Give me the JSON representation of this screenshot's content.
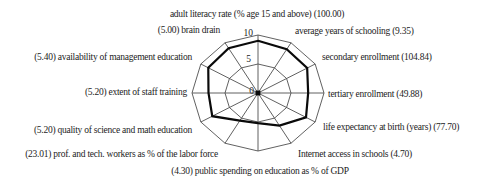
{
  "figure": {
    "background": "#ffffff",
    "text_color": "#1c1c1c",
    "grid_color": "#4f4f4f",
    "series_color": "#0a0a0a"
  },
  "chart_data": {
    "type": "radar",
    "title": "",
    "legend": [],
    "grid": true,
    "scale": {
      "min": 0,
      "max": 10,
      "rings": [
        5,
        10
      ],
      "ticks": [
        "0",
        "5",
        "10"
      ]
    },
    "axes": [
      {
        "label": "adult literacy rate (% age 15 and above) (100.00)",
        "actual_value": 100.0,
        "plotted_score": 9.0
      },
      {
        "label": "average years of schooling (9.35)",
        "actual_value": 9.35,
        "plotted_score": 8.7
      },
      {
        "label": "secondary enrollment (104.84)",
        "actual_value": 104.84,
        "plotted_score": 8.6
      },
      {
        "label": "tertiary enrollment (49.88)",
        "actual_value": 49.88,
        "plotted_score": 7.6
      },
      {
        "label": "life expectancy at birth (years) (77.70)",
        "actual_value": 77.7,
        "plotted_score": 8.4
      },
      {
        "label": "Internet access in schools (4.70)",
        "actual_value": 4.7,
        "plotted_score": 6.5
      },
      {
        "label": "(4.30) public spending on education as % of GDP",
        "actual_value": 4.3,
        "plotted_score": 5.2
      },
      {
        "label": "(23.01) prof. and tech. workers as % of the labor force",
        "actual_value": 23.01,
        "plotted_score": 5.5
      },
      {
        "label": "(5.20) quality of science and math education",
        "actual_value": 5.2,
        "plotted_score": 8.0
      },
      {
        "label": "(5.20) extent of staff training",
        "actual_value": 5.2,
        "plotted_score": 7.5
      },
      {
        "label": "(5.40) availability of management education",
        "actual_value": 5.4,
        "plotted_score": 8.7
      },
      {
        "label": "(5.00) brain drain",
        "actual_value": 5.0,
        "plotted_score": 8.9
      }
    ]
  }
}
